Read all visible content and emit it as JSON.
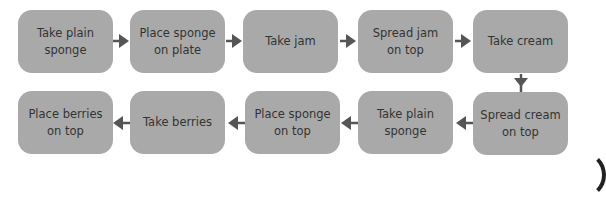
{
  "diagram": {
    "type": "flowchart",
    "colors": {
      "box_fill": "#a9a9a9",
      "text": "#333333",
      "arrow": "#555555",
      "background": "#ffffff"
    },
    "steps": [
      {
        "id": 1,
        "label": "Take plain sponge"
      },
      {
        "id": 2,
        "label": "Place sponge on plate"
      },
      {
        "id": 3,
        "label": "Take jam"
      },
      {
        "id": 4,
        "label": "Spread jam on top"
      },
      {
        "id": 5,
        "label": "Take cream"
      },
      {
        "id": 6,
        "label": "Spread cream on top"
      },
      {
        "id": 7,
        "label": "Take plain sponge"
      },
      {
        "id": 8,
        "label": "Place sponge on top"
      },
      {
        "id": 9,
        "label": "Take berries"
      },
      {
        "id": 10,
        "label": "Place berries on top"
      }
    ],
    "connections": [
      {
        "from": 1,
        "to": 2,
        "direction": "right"
      },
      {
        "from": 2,
        "to": 3,
        "direction": "right"
      },
      {
        "from": 3,
        "to": 4,
        "direction": "right"
      },
      {
        "from": 4,
        "to": 5,
        "direction": "right"
      },
      {
        "from": 5,
        "to": 6,
        "direction": "down"
      },
      {
        "from": 6,
        "to": 7,
        "direction": "left"
      },
      {
        "from": 7,
        "to": 8,
        "direction": "left"
      },
      {
        "from": 8,
        "to": 9,
        "direction": "left"
      },
      {
        "from": 9,
        "to": 10,
        "direction": "left"
      }
    ]
  }
}
